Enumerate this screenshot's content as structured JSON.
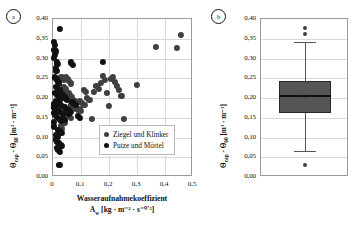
{
  "figure": {
    "panels": [
      {
        "tag": "a",
        "type": "scatter"
      },
      {
        "tag": "b",
        "type": "box"
      }
    ]
  },
  "panel_a": {
    "tag": "a",
    "ylabel_main": "Θ",
    "ylabel_sub1": "cap",
    "ylabel_mid": " - Θ",
    "ylabel_sub2": "80",
    "ylabel_unit": " [m³ · m⁻³]",
    "xlabel_line1": "Wasseraufnahmekoeffizient",
    "xlabel_line2_sym": "A",
    "xlabel_line2_sub": "w",
    "xlabel_line2_unit": " [kg · m⁻² · s⁻⁰˙⁵]",
    "yticks": [
      "0,40",
      "0,35",
      "0,30",
      "0,25",
      "0,20",
      "0,15",
      "0,10",
      "0,05",
      "0,00"
    ],
    "xticks": [
      "0",
      "0,1",
      "0,2",
      "0,3",
      "0,4",
      "0,5"
    ],
    "legend": [
      {
        "label": "Ziegel und Klinker",
        "color": "#3f3f3f"
      },
      {
        "label": "Putze und Mörtel",
        "color": "#111111"
      }
    ]
  },
  "panel_b": {
    "tag": "b",
    "ylabel_main": "Θ",
    "ylabel_sub1": "cap",
    "ylabel_mid": " - Θ",
    "ylabel_sub2": "80",
    "ylabel_unit": " [m³ · m⁻³]",
    "yticks": [
      "0,40",
      "0,35",
      "0,30",
      "0,25",
      "0,20",
      "0,15",
      "0,10",
      "0,05",
      "0,00"
    ]
  },
  "chart_data": [
    {
      "type": "scatter",
      "panel": "a",
      "title": "",
      "xlabel": "Wasseraufnahmekoeffizient A_w [kg · m^-2 · s^-0,5]",
      "ylabel": "Θ_cap - Θ_80 [m³ · m⁻³]",
      "xlim": [
        0,
        0.5
      ],
      "ylim": [
        0.0,
        0.4
      ],
      "xticks": [
        0,
        0.1,
        0.2,
        0.3,
        0.4,
        0.5
      ],
      "yticks": [
        0.0,
        0.05,
        0.1,
        0.15,
        0.2,
        0.25,
        0.3,
        0.35,
        0.4
      ],
      "grid": true,
      "legend_position": "inside-lower-right",
      "series": [
        {
          "name": "Ziegel und Klinker",
          "color": "#3f3f3f",
          "points": [
            [
              0.03,
              0.253
            ],
            [
              0.038,
              0.246
            ],
            [
              0.045,
              0.252
            ],
            [
              0.052,
              0.248
            ],
            [
              0.058,
              0.243
            ],
            [
              0.063,
              0.237
            ],
            [
              0.04,
              0.228
            ],
            [
              0.047,
              0.222
            ],
            [
              0.034,
              0.215
            ],
            [
              0.055,
              0.212
            ],
            [
              0.061,
              0.207
            ],
            [
              0.068,
              0.202
            ],
            [
              0.072,
              0.196
            ],
            [
              0.079,
              0.192
            ],
            [
              0.086,
              0.188
            ],
            [
              0.066,
              0.182
            ],
            [
              0.074,
              0.178
            ],
            [
              0.082,
              0.173
            ],
            [
              0.09,
              0.169
            ],
            [
              0.097,
              0.192
            ],
            [
              0.104,
              0.188
            ],
            [
              0.112,
              0.183
            ],
            [
              0.043,
              0.165
            ],
            [
              0.05,
              0.16
            ],
            [
              0.057,
              0.155
            ],
            [
              0.064,
              0.15
            ],
            [
              0.035,
              0.143
            ],
            [
              0.042,
              0.138
            ],
            [
              0.028,
              0.129
            ],
            [
              0.033,
              0.123
            ],
            [
              0.14,
              0.148
            ],
            [
              0.147,
              0.216
            ],
            [
              0.155,
              0.231
            ],
            [
              0.163,
              0.223
            ],
            [
              0.171,
              0.238
            ],
            [
              0.178,
              0.256
            ],
            [
              0.186,
              0.245
            ],
            [
              0.193,
              0.212
            ],
            [
              0.2,
              0.18
            ],
            [
              0.208,
              0.248
            ],
            [
              0.215,
              0.253
            ],
            [
              0.222,
              0.241
            ],
            [
              0.229,
              0.23
            ],
            [
              0.236,
              0.221
            ],
            [
              0.244,
              0.205
            ],
            [
              0.252,
              0.147
            ],
            [
              0.3,
              0.234
            ],
            [
              0.368,
              0.33
            ],
            [
              0.443,
              0.327
            ],
            [
              0.458,
              0.36
            ],
            [
              0.122,
              0.2
            ],
            [
              0.13,
              0.196
            ],
            [
              0.11,
              0.221
            ],
            [
              0.118,
              0.216
            ],
            [
              0.095,
              0.172
            ],
            [
              0.101,
              0.167
            ]
          ]
        },
        {
          "name": "Putze und Mörtel",
          "color": "#111111",
          "points": [
            [
              0.004,
              0.341
            ],
            [
              0.007,
              0.334
            ],
            [
              0.005,
              0.322
            ],
            [
              0.009,
              0.318
            ],
            [
              0.006,
              0.309
            ],
            [
              0.003,
              0.301
            ],
            [
              0.026,
              0.375
            ],
            [
              0.013,
              0.292
            ],
            [
              0.016,
              0.286
            ],
            [
              0.01,
              0.276
            ],
            [
              0.012,
              0.268
            ],
            [
              0.064,
              0.29
            ],
            [
              0.07,
              0.283
            ],
            [
              0.178,
              0.292
            ],
            [
              0.008,
              0.252
            ],
            [
              0.014,
              0.247
            ],
            [
              0.019,
              0.241
            ],
            [
              0.022,
              0.236
            ],
            [
              0.011,
              0.228
            ],
            [
              0.017,
              0.223
            ],
            [
              0.024,
              0.219
            ],
            [
              0.006,
              0.212
            ],
            [
              0.013,
              0.207
            ],
            [
              0.02,
              0.203
            ],
            [
              0.028,
              0.199
            ],
            [
              0.009,
              0.193
            ],
            [
              0.016,
              0.189
            ],
            [
              0.023,
              0.185
            ],
            [
              0.031,
              0.181
            ],
            [
              0.005,
              0.176
            ],
            [
              0.012,
              0.172
            ],
            [
              0.019,
              0.168
            ],
            [
              0.026,
              0.164
            ],
            [
              0.034,
              0.16
            ],
            [
              0.041,
              0.177
            ],
            [
              0.048,
              0.173
            ],
            [
              0.055,
              0.169
            ],
            [
              0.062,
              0.165
            ],
            [
              0.069,
              0.19
            ],
            [
              0.076,
              0.186
            ],
            [
              0.083,
              0.182
            ],
            [
              0.09,
              0.155
            ],
            [
              0.097,
              0.15
            ],
            [
              0.007,
              0.158
            ],
            [
              0.014,
              0.152
            ],
            [
              0.021,
              0.147
            ],
            [
              0.029,
              0.142
            ],
            [
              0.036,
              0.15
            ],
            [
              0.043,
              0.145
            ],
            [
              0.018,
              0.12
            ],
            [
              0.024,
              0.116
            ],
            [
              0.03,
              0.112
            ],
            [
              0.012,
              0.107
            ],
            [
              0.017,
              0.101
            ],
            [
              0.01,
              0.095
            ],
            [
              0.015,
              0.09
            ],
            [
              0.021,
              0.086
            ],
            [
              0.027,
              0.082
            ],
            [
              0.033,
              0.079
            ],
            [
              0.013,
              0.073
            ],
            [
              0.019,
              0.068
            ],
            [
              0.025,
              0.064
            ],
            [
              0.023,
              0.031
            ],
            [
              0.002,
              0.185
            ],
            [
              0.002,
              0.163
            ],
            [
              0.003,
              0.14
            ],
            [
              0.004,
              0.128
            ],
            [
              0.058,
              0.16
            ],
            [
              0.051,
              0.196
            ],
            [
              0.044,
              0.201
            ],
            [
              0.037,
              0.206
            ],
            [
              0.03,
              0.21
            ]
          ]
        }
      ]
    },
    {
      "type": "box",
      "panel": "b",
      "title": "",
      "ylabel": "Θ_cap - Θ_80 [m³ · m⁻³]",
      "ylim": [
        0.0,
        0.4
      ],
      "yticks": [
        0.0,
        0.05,
        0.1,
        0.15,
        0.2,
        0.25,
        0.3,
        0.35,
        0.4
      ],
      "grid": true,
      "boxes": [
        {
          "name": "alle Materialien",
          "q1": 0.163,
          "median": 0.205,
          "q3": 0.242,
          "whisker_low": 0.067,
          "whisker_high": 0.341,
          "mean": 0.202,
          "mean_marker": "×",
          "outliers": [
            0.378,
            0.361,
            0.031
          ],
          "box_color": "#555555"
        }
      ]
    }
  ]
}
